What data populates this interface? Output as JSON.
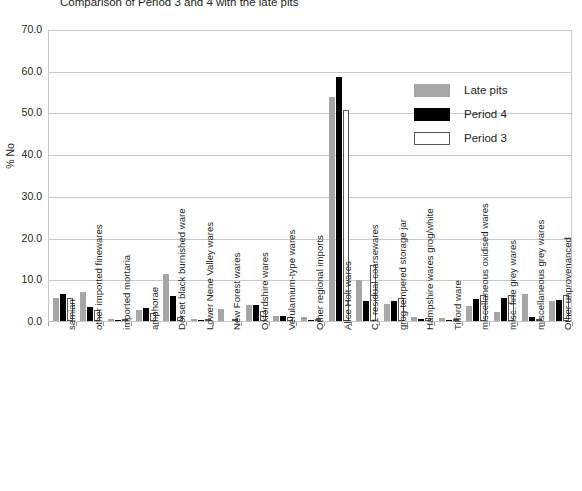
{
  "chart_data": {
    "type": "bar",
    "title": "Comparison of Period 3 and 4 with the late pits",
    "xlabel": "",
    "ylabel": "% No",
    "ylim": [
      0,
      70
    ],
    "ytick_labels": [
      "70.0",
      "60.0",
      "50.0",
      "40.0",
      "30.0",
      "20.0",
      "10.0",
      "0.0"
    ],
    "ytick_values": [
      70,
      60,
      50,
      40,
      30,
      20,
      10,
      0
    ],
    "grid": true,
    "legend_position": "upper-right",
    "categories": [
      "samian",
      "other imported finewares",
      "imported mortaria",
      "amphorae",
      "Dorset black burnished ware",
      "Lower Nene Valley wares",
      "New Forest wares",
      "Oxfordshire wares",
      "Verulamium-type wares",
      "Other regional imports",
      "Alice Holt wares",
      "C1 residual coarsewares",
      "grog-tempered storage jar",
      "Hampshire wares grog/white",
      "Tilford ware",
      "miscellaneous oxidised wares",
      "misc. fine grey wares",
      "miscellaneous grey wares",
      "Other unprovenanced"
    ],
    "series": [
      {
        "name": "Late pits",
        "color": "#a6a6a6",
        "values": [
          5.5,
          7.0,
          0.4,
          2.6,
          11.3,
          0.5,
          2.8,
          3.9,
          1.1,
          0.9,
          53.8,
          9.8,
          4.0,
          1.0,
          0.8,
          3.6,
          2.2,
          6.4,
          4.9
        ]
      },
      {
        "name": "Period 4",
        "color": "#000000",
        "values": [
          6.4,
          3.3,
          0.2,
          3.1,
          6.0,
          0.3,
          0.0,
          3.9,
          1.1,
          0.2,
          58.5,
          4.9,
          4.8,
          0.4,
          0.2,
          5.2,
          5.5,
          1.0,
          5.0
        ]
      },
      {
        "name": "Period 3",
        "color": "#ffffff",
        "values": [
          5.6,
          2.6,
          0.3,
          2.0,
          0.9,
          0.2,
          0.0,
          2.4,
          1.0,
          0.2,
          50.7,
          13.4,
          5.4,
          0.8,
          0.2,
          6.2,
          6.3,
          0.3,
          6.2
        ]
      }
    ]
  },
  "legend": {
    "items": [
      {
        "label": "Late pits",
        "swatch": "late"
      },
      {
        "label": "Period 4",
        "swatch": "p4"
      },
      {
        "label": "Period 3",
        "swatch": "p3"
      }
    ]
  }
}
